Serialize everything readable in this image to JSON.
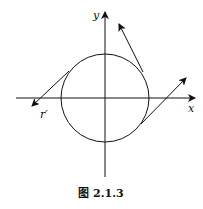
{
  "figure": {
    "caption": "图 2.1.3",
    "axis_labels": {
      "x": "x",
      "y": "y"
    },
    "vector_label": "r′",
    "colors": {
      "stroke": "#111111",
      "background": "#ffffff"
    },
    "geometry": {
      "origin": [
        105,
        98
      ],
      "circle_radius": 44,
      "vectors": [
        {
          "name": "r-prime",
          "from": [
            69,
            71
          ],
          "to": [
            32,
            106
          ]
        },
        {
          "name": "upper-right",
          "from": [
            143,
            72
          ],
          "to": [
            119,
            24
          ]
        },
        {
          "name": "lower-right",
          "from": [
            141,
            124
          ],
          "to": [
            186,
            78
          ]
        }
      ]
    }
  }
}
